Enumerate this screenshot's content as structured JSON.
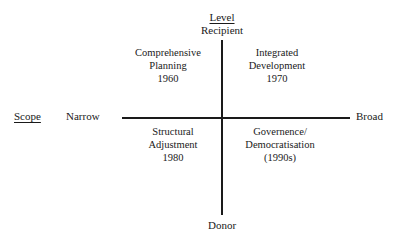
{
  "diagram": {
    "type": "quadrant-matrix",
    "axes": {
      "vertical": {
        "title": "Level",
        "top_label": "Recipient",
        "bottom_label": "Donor"
      },
      "horizontal": {
        "title": "Scope",
        "left_label": "Narrow",
        "right_label": "Broad"
      }
    },
    "quadrants": [
      {
        "position": "top-left",
        "line1": "Comprehensive",
        "line2": "Planning",
        "line3": "1960"
      },
      {
        "position": "top-right",
        "line1": "Integrated",
        "line2": "Development",
        "line3": "1970"
      },
      {
        "position": "bottom-left",
        "line1": "Structural",
        "line2": "Adjustment",
        "line3": "1980"
      },
      {
        "position": "bottom-right",
        "line1": "Governence/",
        "line2": "Democratisation",
        "line3": "(1990s)"
      }
    ],
    "colors": {
      "ink": "#1a1a1a",
      "background": "#ffffff"
    }
  }
}
